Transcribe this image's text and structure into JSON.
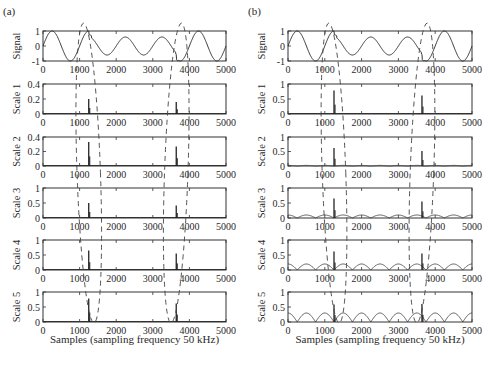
{
  "figure": {
    "panels": [
      {
        "id": "a",
        "label": "(a)"
      },
      {
        "id": "b",
        "label": "(b)"
      }
    ],
    "xlabel": "Samples (sampling frequency 50 kHz)"
  },
  "chart_data": [
    {
      "panel": "(a)",
      "type": "line",
      "xlabel": "Samples (sampling frequency 50 kHz)",
      "xlim": [
        0,
        5000
      ],
      "xticks": [
        0,
        1000,
        2000,
        3000,
        4000,
        5000
      ],
      "subplots": [
        {
          "ylabel": "Signal",
          "ylim": [
            -1,
            1
          ],
          "yticks": [
            -1,
            0,
            1
          ],
          "description": "sine wave period ~1000 samples, amplitude 1; sag to amplitude ~0.6 between ~1250 and ~3650, full amplitude after",
          "sag_start": 1250,
          "sag_end": 3650,
          "sag_amplitude": 0.6
        },
        {
          "ylabel": "Scale 1",
          "ylim": [
            0,
            0.4
          ],
          "yticks": [
            0,
            0.2,
            0.4
          ],
          "spikes": [
            {
              "x": 1250,
              "y": 0.2
            },
            {
              "x": 3640,
              "y": 0.16
            }
          ]
        },
        {
          "ylabel": "Scale 2",
          "ylim": [
            0,
            0.4
          ],
          "yticks": [
            0,
            0.2,
            0.4
          ],
          "spikes": [
            {
              "x": 1250,
              "y": 0.33
            },
            {
              "x": 3640,
              "y": 0.27
            }
          ]
        },
        {
          "ylabel": "Scale 3",
          "ylim": [
            0,
            1
          ],
          "yticks": [
            0,
            0.5,
            1
          ],
          "spikes": [
            {
              "x": 1250,
              "y": 0.5
            },
            {
              "x": 3640,
              "y": 0.42
            }
          ]
        },
        {
          "ylabel": "Scale 4",
          "ylim": [
            0,
            1
          ],
          "yticks": [
            0,
            0.5,
            1
          ],
          "spikes": [
            {
              "x": 1250,
              "y": 0.65
            },
            {
              "x": 3640,
              "y": 0.55
            }
          ]
        },
        {
          "ylabel": "Scale 5",
          "ylim": [
            0,
            1
          ],
          "yticks": [
            0,
            0.5,
            1
          ],
          "spikes": [
            {
              "x": 1250,
              "y": 0.78
            },
            {
              "x": 3640,
              "y": 0.62
            }
          ]
        }
      ]
    },
    {
      "panel": "(b)",
      "type": "line",
      "xlabel": "Samples (sampling frequency 50 kHz)",
      "xlim": [
        0,
        5000
      ],
      "xticks": [
        0,
        1000,
        2000,
        3000,
        4000,
        5000
      ],
      "subplots": [
        {
          "ylabel": "Signal",
          "ylim": [
            -1,
            1
          ],
          "yticks": [
            -1,
            0,
            1
          ],
          "description": "sine wave period ~1000 samples, amplitude 1; sag to amplitude ~0.6 between ~1250 and ~3650, full amplitude after",
          "sag_start": 1250,
          "sag_end": 3650,
          "sag_amplitude": 0.6
        },
        {
          "ylabel": "Scale 1",
          "ylim": [
            0,
            1
          ],
          "yticks": [
            0,
            0.5,
            1
          ],
          "spikes": [
            {
              "x": 1250,
              "y": 0.78
            },
            {
              "x": 3640,
              "y": 0.62
            }
          ],
          "baseline_arch_amplitude": 0
        },
        {
          "ylabel": "Scale 2",
          "ylim": [
            0,
            1
          ],
          "yticks": [
            0,
            0.5,
            1
          ],
          "spikes": [
            {
              "x": 1250,
              "y": 0.62
            },
            {
              "x": 3640,
              "y": 0.52
            }
          ],
          "baseline_arch_amplitude": 0.02
        },
        {
          "ylabel": "Scale 3",
          "ylim": [
            0,
            1
          ],
          "yticks": [
            0,
            0.5,
            1
          ],
          "spikes": [
            {
              "x": 1250,
              "y": 0.65
            },
            {
              "x": 3640,
              "y": 0.55
            }
          ],
          "baseline_arch_amplitude": 0.1
        },
        {
          "ylabel": "Scale 4",
          "ylim": [
            0,
            1
          ],
          "yticks": [
            0,
            0.5,
            1
          ],
          "spikes": [
            {
              "x": 1250,
              "y": 0.62
            },
            {
              "x": 3640,
              "y": 0.55
            }
          ],
          "baseline_arch_amplitude": 0.2
        },
        {
          "ylabel": "Scale 5",
          "ylim": [
            0,
            1
          ],
          "yticks": [
            0,
            0.5,
            1
          ],
          "spikes": [
            {
              "x": 1250,
              "y": 0.58
            },
            {
              "x": 3640,
              "y": 0.6
            }
          ],
          "baseline_arch_amplitude": 0.3
        }
      ]
    }
  ],
  "annotations": {
    "dashed_ellipses": [
      {
        "center_x": 1250,
        "description": "dashed ellipse spanning all subplots around disturbance at ~1250"
      },
      {
        "center_x": 3640,
        "description": "dashed ellipse spanning all subplots around disturbance at ~3640"
      }
    ]
  }
}
